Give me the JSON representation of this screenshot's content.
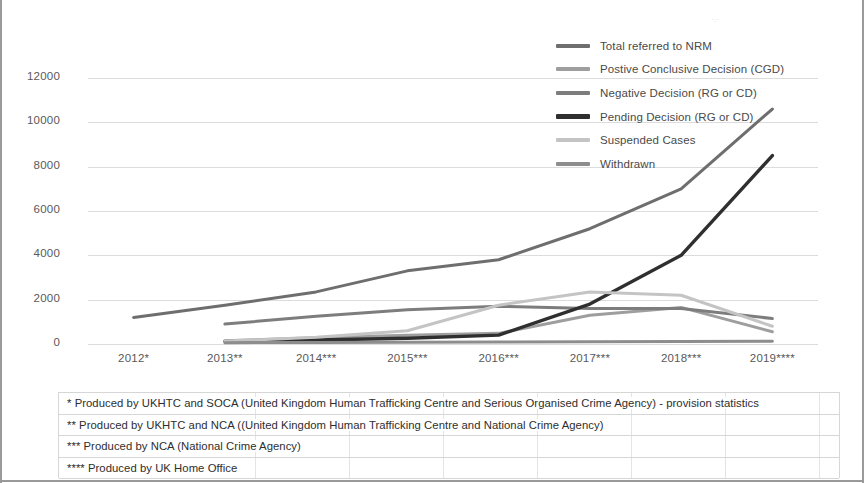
{
  "chart_data": {
    "type": "line",
    "title": "",
    "xlabel": "",
    "ylabel": "",
    "categories": [
      "2012*",
      "2013**",
      "2014***",
      "2015***",
      "2016***",
      "2017***",
      "2018***",
      "2019****"
    ],
    "ylim": [
      0,
      12000
    ],
    "yticks": [
      0,
      2000,
      4000,
      6000,
      8000,
      10000,
      12000
    ],
    "grid": true,
    "legend_position": "top-right",
    "series": [
      {
        "name": "Total referred to NRM",
        "color": "#6e6e6e",
        "x": [
          "2012*",
          "2013**",
          "2014***",
          "2015***",
          "2016***",
          "2017***",
          "2018***",
          "2019****"
        ],
        "values": [
          1200,
          1750,
          2350,
          3300,
          3800,
          5200,
          7000,
          10600
        ]
      },
      {
        "name": "Postive Conclusive Decision (CGD)",
        "color": "#9e9e9e",
        "x": [
          "2013**",
          "2014***",
          "2015***",
          "2016***",
          "2017***",
          "2018***",
          "2019****"
        ],
        "values": [
          150,
          280,
          400,
          480,
          1300,
          1650,
          550
        ]
      },
      {
        "name": "Negative Decision (RG or CD)",
        "color": "#7d7d7d",
        "x": [
          "2013**",
          "2014***",
          "2015***",
          "2016***",
          "2017***",
          "2018***",
          "2019****"
        ],
        "values": [
          900,
          1250,
          1550,
          1700,
          1600,
          1600,
          1150
        ]
      },
      {
        "name": "Pending Decision (RG or CD)",
        "color": "#2f2f2f",
        "x": [
          "2013**",
          "2014***",
          "2015***",
          "2016***",
          "2017***",
          "2018***",
          "2019****"
        ],
        "values": [
          120,
          180,
          260,
          400,
          1800,
          4000,
          8500
        ]
      },
      {
        "name": "Suspended Cases",
        "color": "#c4c4c4",
        "x": [
          "2013**",
          "2014***",
          "2015***",
          "2016***",
          "2017***",
          "2018***",
          "2019****"
        ],
        "values": [
          130,
          300,
          600,
          1750,
          2350,
          2200,
          800
        ]
      },
      {
        "name": "Withdrawn",
        "color": "#8d8d8d",
        "x": [
          "2013**",
          "2014***",
          "2015***",
          "2016***",
          "2017***",
          "2018***",
          "2019****"
        ],
        "values": [
          60,
          70,
          80,
          90,
          100,
          110,
          120
        ]
      }
    ]
  },
  "notes": [
    "* Produced by UKHTC  and SOCA (United Kingdom Human Trafficking Centre and Serious Organised Crime Agency) - provision statistics",
    "** Produced by UKHTC and NCA ((United Kingdom Human Trafficking Centre and National Crime Agency)",
    "*** Produced by NCA (National Crime Agency)",
    "**** Produced by UK Home Office"
  ]
}
